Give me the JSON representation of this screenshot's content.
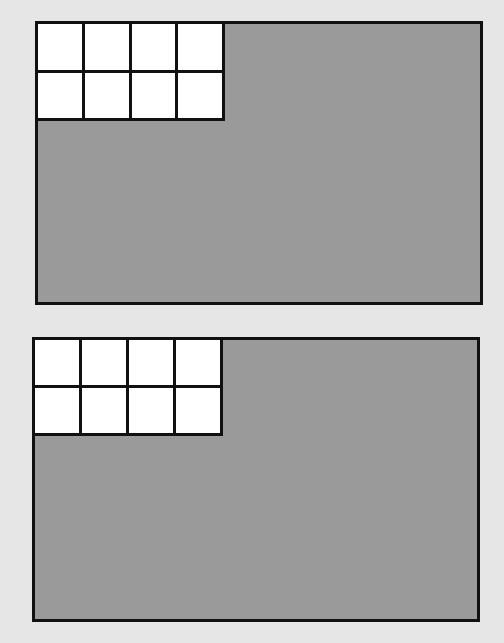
{
  "diagrams": [
    {
      "label": "top-rectangle",
      "fill_color": "#9a9a9a",
      "grid": {
        "rows": 2,
        "cols": 4,
        "shaded_cells": 8,
        "cell_color": "#ffffff"
      }
    },
    {
      "label": "bottom-rectangle",
      "fill_color": "#9a9a9a",
      "grid": {
        "rows": 2,
        "cols": 4,
        "shaded_cells": 8,
        "cell_color": "#ffffff"
      }
    }
  ]
}
